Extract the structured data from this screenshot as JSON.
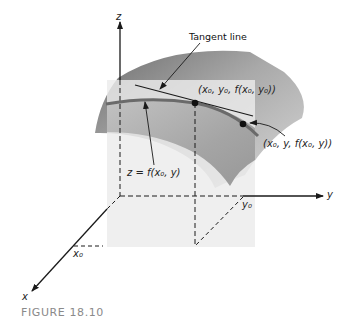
{
  "figure": {
    "caption": "FIGURE 18.10",
    "labels": {
      "tangent_line": "Tangent line",
      "point_p0": "(x₀, y₀, f(x₀, y₀))",
      "point_p": "(x₀, y, f(x₀, y))",
      "curve": "z = f(x₀, y)",
      "axis_x": "x",
      "axis_y": "y",
      "axis_z": "z",
      "tick_x0": "x₀",
      "tick_y0": "y₀"
    },
    "colors": {
      "plane": "#ececec",
      "surface_dark": "#7a7a7a",
      "surface_light": "#d2d2d2",
      "curve": "#6e6e6e",
      "axis": "#1a1a1a",
      "caption": "#8a8a8a"
    }
  }
}
